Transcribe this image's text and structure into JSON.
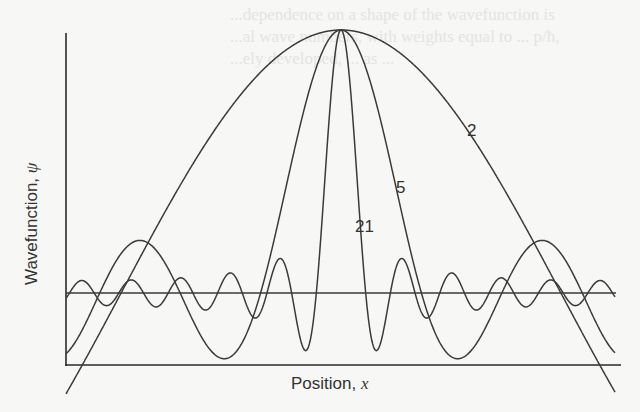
{
  "chart_data": {
    "type": "line",
    "title": "",
    "xlabel": "Position, x",
    "ylabel": "Wavefunction, ψ",
    "xlabel_text": "Position, ",
    "xlabel_var": "x",
    "ylabel_text": "Wavefunction, ",
    "ylabel_var": "ψ",
    "grid": false,
    "legend": "inline labels on curves",
    "series": [
      {
        "name": "2",
        "N": 2,
        "description": "broad cosine-like packet from superposition of 2 waves"
      },
      {
        "name": "5",
        "N": 5,
        "description": "narrower packet from 5 waves"
      },
      {
        "name": "21",
        "N": 21,
        "description": "sharply localized packet from 21 waves"
      }
    ],
    "annotations": [
      {
        "text": "2",
        "x_px": 467,
        "y_px": 130
      },
      {
        "text": "5",
        "x_px": 396,
        "y_px": 187
      },
      {
        "text": "21",
        "x_px": 355,
        "y_px": 226
      }
    ],
    "x_range_px": [
      66,
      615
    ],
    "peak_px": {
      "x": 341,
      "y": 30
    },
    "baseline_y_px": 293,
    "axis_y_px": 365,
    "scale_px_per_rad": 140,
    "colors": {
      "line": "#3a3a3a",
      "axis": "#2a2a2a",
      "background": "#f7f7f6"
    }
  },
  "background_text": [
    "...dependence on a shape of the wavefunction is",
    "...al wave numbers, with weights equal to ... p/ħ,",
    "...ely developed, ... as ..."
  ]
}
